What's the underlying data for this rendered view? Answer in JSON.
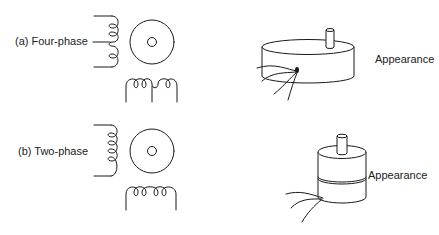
{
  "figure": {
    "panels": [
      {
        "id": "a",
        "label": "(a) Four-phase",
        "appearance_label": "Appearance",
        "winding_type": "center-tapped (bifilar) coils",
        "motor_shape": "flat pancake cylinder"
      },
      {
        "id": "b",
        "label": "(b) Two-phase",
        "appearance_label": "Appearance",
        "winding_type": "simple coils",
        "motor_shape": "tall narrow cylinder"
      }
    ]
  },
  "colors": {
    "line": "#1a1a1a",
    "text": "#222222",
    "background": "#ffffff"
  }
}
